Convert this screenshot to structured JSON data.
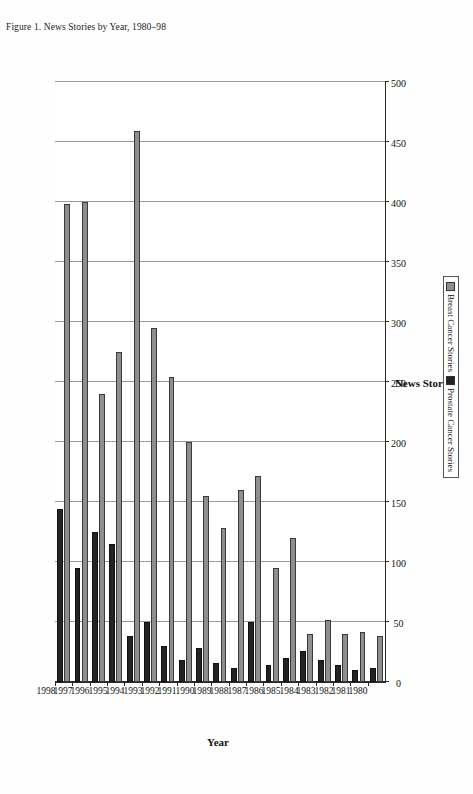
{
  "figure": {
    "caption": "Figure 1. News Stories by Year, 1980–98"
  },
  "legend": {
    "position": "bottom",
    "items": [
      {
        "label": "Breast Cancer Stories",
        "color": "#8e8e8e"
      },
      {
        "label": "Prostate Cancer Stories",
        "color": "#232323"
      }
    ]
  },
  "axes": {
    "category_title": "Year",
    "value_title": "News Stories"
  },
  "chart_data": {
    "type": "bar",
    "orientation": "horizontal",
    "title": "Figure 1. News Stories by Year, 1980–98",
    "xlabel": "News Stories",
    "ylabel": "Year",
    "xlim": [
      0,
      500
    ],
    "xticks": [
      0,
      50,
      100,
      150,
      200,
      250,
      300,
      350,
      400,
      450,
      500
    ],
    "grid": true,
    "legend_position": "bottom",
    "categories": [
      "1980",
      "1981",
      "1982",
      "1983",
      "1984",
      "1985",
      "1986",
      "1987",
      "1988",
      "1989",
      "1990",
      "1991",
      "1992",
      "1993",
      "1994",
      "1995",
      "1996",
      "1997",
      "1998"
    ],
    "series": [
      {
        "name": "Breast Cancer Stories",
        "color": "#8e8e8e",
        "values": [
          38,
          42,
          40,
          52,
          40,
          120,
          95,
          172,
          160,
          128,
          155,
          200,
          254,
          295,
          459,
          275,
          240,
          400,
          398
        ]
      },
      {
        "name": "Prostate Cancer Stories",
        "color": "#232323",
        "values": [
          12,
          10,
          14,
          18,
          26,
          20,
          14,
          50,
          12,
          16,
          28,
          18,
          30,
          50,
          38,
          115,
          125,
          95,
          144
        ]
      }
    ]
  }
}
